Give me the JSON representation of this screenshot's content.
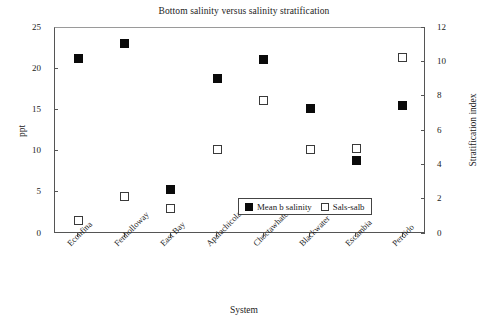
{
  "chart_data": {
    "type": "scatter",
    "title": "Bottom salinity versus salinity stratification",
    "xlabel": "System",
    "ylabel": "ppt",
    "y2label": "Stratification index",
    "categories": [
      "Econfina",
      "Fenholloway",
      "East Bay",
      "Apalachicola",
      "Choctawhatchee",
      "Blackwater",
      "Escambia",
      "Perdido"
    ],
    "ylim": [
      0,
      25
    ],
    "yticks": [
      0,
      5,
      10,
      15,
      20,
      25
    ],
    "y2lim": [
      0,
      12
    ],
    "y2ticks": [
      0,
      2,
      4,
      6,
      8,
      10,
      12
    ],
    "grid": false,
    "legend_position": "inside-bottom-right",
    "series": [
      {
        "name": "Mean b salinity",
        "axis": "left",
        "marker": "filled-square",
        "color": "#0a0a0a",
        "values": [
          21.3,
          23.1,
          5.4,
          18.9,
          21.2,
          15.2,
          8.9,
          15.6
        ]
      },
      {
        "name": "Sals-salb",
        "axis": "right",
        "marker": "open-square",
        "color": "#ffffff",
        "values": [
          0.8,
          2.2,
          1.5,
          4.9,
          7.8,
          4.9,
          5.0,
          10.3
        ]
      }
    ]
  }
}
